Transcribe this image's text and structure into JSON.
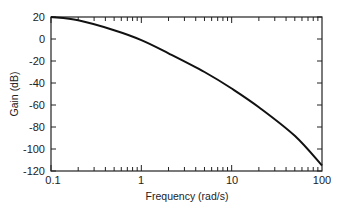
{
  "chart_data": {
    "type": "line",
    "title": "",
    "xlabel": "Frequency (rad/s)",
    "ylabel": "Gain (dB)",
    "xscale": "log",
    "xlim": [
      0.1,
      100
    ],
    "ylim": [
      -120,
      20
    ],
    "grid": false,
    "legend": null,
    "x_ticks": [
      "0.1",
      "1",
      "10",
      "100"
    ],
    "y_ticks": [
      "20",
      "0",
      "-20",
      "-40",
      "-60",
      "-80",
      "-100",
      "-120"
    ],
    "series": [
      {
        "name": "Gain",
        "x": [
          0.1,
          0.2,
          0.5,
          1,
          2,
          5,
          10,
          20,
          50,
          100
        ],
        "values": [
          20,
          17,
          8,
          -1,
          -13,
          -30,
          -45,
          -62,
          -88,
          -115
        ]
      }
    ]
  },
  "labels": {
    "xlabel": "Frequency (rad/s)",
    "ylabel": "Gain (dB)",
    "x_ticks": [
      "0.1",
      "1",
      "10",
      "100"
    ],
    "y_ticks": [
      "20",
      "0",
      "-20",
      "-40",
      "-60",
      "-80",
      "-100",
      "-120"
    ]
  }
}
